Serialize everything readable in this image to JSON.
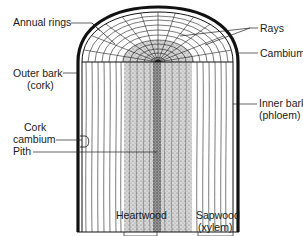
{
  "diagram": {
    "colors": {
      "ink": "#111111",
      "heartwood_stipple": "#8a8a8a",
      "background": "#ffffff"
    },
    "labels": {
      "annual_rings": "Annual rings",
      "rays": "Rays",
      "cambium": "Cambium",
      "outer_bark_1": "Outer bark",
      "outer_bark_2": "(cork)",
      "cork_cambium_1": "Cork",
      "cork_cambium_2": "cambium",
      "inner_bark_1": "Inner bark",
      "inner_bark_2": "(phloem)",
      "pith": "Pith",
      "heartwood": "Heartwood",
      "sapwood_1": "Sapwood",
      "sapwood_2": "(xylem)"
    }
  }
}
